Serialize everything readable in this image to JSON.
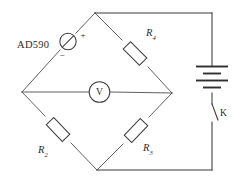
{
  "diagram": {
    "background_color": "#ffffff",
    "wire_color": "#3a3a3a",
    "label_color": "#2b2b2b"
  },
  "components": {
    "sensor": {
      "name": "AD590",
      "label": "AD590",
      "symbol": "current-source",
      "plus_sign": "+",
      "minus_sign": "−"
    },
    "meter": {
      "label": "V",
      "symbol": "voltmeter"
    },
    "battery": {
      "symbol": "battery",
      "plate_count": 4
    },
    "switch": {
      "label": "K",
      "symbol": "switch-open"
    },
    "resistors": [
      {
        "id": "r4",
        "base": "R",
        "subscript": "4",
        "position": "top-right-arm"
      },
      {
        "id": "r2",
        "base": "R",
        "subscript": "2",
        "position": "bottom-left-arm"
      },
      {
        "id": "r3",
        "base": "R",
        "subscript": "3",
        "position": "bottom-right-arm"
      }
    ]
  }
}
